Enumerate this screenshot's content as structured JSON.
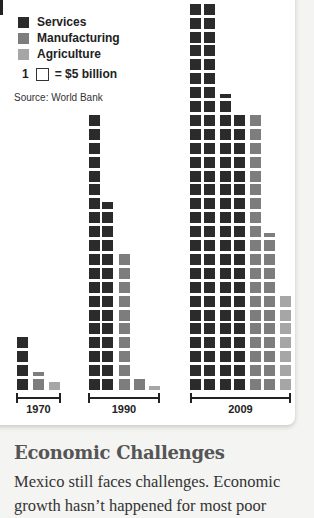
{
  "legend": {
    "items": [
      {
        "label": "Services",
        "color": "#2b2b2b"
      },
      {
        "label": "Manufacturing",
        "color": "#7d7d7d"
      },
      {
        "label": "Agriculture",
        "color": "#a6a6a6"
      }
    ],
    "scale_count": "1",
    "scale_value": "= $5 billion",
    "source": "Source: World Bank"
  },
  "chart_data": {
    "type": "bar",
    "title": "",
    "xlabel": "",
    "ylabel": "",
    "unit": "1 square = $5 billion",
    "categories": [
      "1970",
      "1990",
      "2009"
    ],
    "series": [
      {
        "name": "Services",
        "blocks": [
          4,
          33.6,
          97.4
        ],
        "values": [
          20,
          168,
          487
        ]
      },
      {
        "name": "Manufacturing",
        "blocks": [
          1.4,
          11,
          31.4
        ],
        "values": [
          7,
          55,
          157
        ]
      },
      {
        "name": "Agriculture",
        "blocks": [
          0.7,
          0.4,
          7
        ],
        "values": [
          3.5,
          2,
          35
        ]
      }
    ],
    "source": "Source: World Bank",
    "grid": false,
    "legend_position": "top-left",
    "columns": [
      {
        "year": "1970",
        "x": 17,
        "series": 0,
        "blocks": 4
      },
      {
        "year": "1970",
        "x": 33,
        "series": 1,
        "blocks": 1.4
      },
      {
        "year": "1970",
        "x": 49,
        "series": 2,
        "blocks": 0.7
      },
      {
        "year": "1990",
        "x": 89,
        "series": 0,
        "blocks": 20
      },
      {
        "year": "1990",
        "x": 102,
        "series": 0,
        "blocks": 13.6
      },
      {
        "year": "1990",
        "x": 119,
        "series": 1,
        "blocks": 10
      },
      {
        "year": "1990",
        "x": 134,
        "series": 1,
        "blocks": 1
      },
      {
        "year": "1990",
        "x": 149,
        "series": 2,
        "blocks": 0.4
      },
      {
        "year": "2009",
        "x": 190,
        "series": 0,
        "blocks": 28
      },
      {
        "year": "2009",
        "x": 204,
        "series": 0,
        "blocks": 28
      },
      {
        "year": "2009",
        "x": 220,
        "series": 0,
        "blocks": 21.4
      },
      {
        "year": "2009",
        "x": 234,
        "series": 0,
        "blocks": 20
      },
      {
        "year": "2009",
        "x": 250,
        "series": 1,
        "blocks": 20
      },
      {
        "year": "2009",
        "x": 264,
        "series": 1,
        "blocks": 11.4
      },
      {
        "year": "2009",
        "x": 280,
        "series": 2,
        "blocks": 7
      }
    ],
    "axes": [
      {
        "label": "1970",
        "x1": 16,
        "x2": 61
      },
      {
        "label": "1990",
        "x1": 88,
        "x2": 160
      },
      {
        "label": "2009",
        "x1": 190,
        "x2": 291
      }
    ]
  },
  "section": {
    "heading": "Economic Challenges",
    "body": "Mexico still faces challenges. Economic growth hasn’t happened for most poor"
  }
}
